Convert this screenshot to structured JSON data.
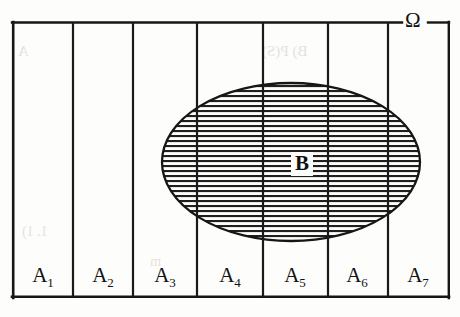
{
  "figure": {
    "type": "venn-partition-diagram",
    "universe_label": "Ω",
    "set_label": "B",
    "partition_labels": [
      {
        "base": "A",
        "sub": "1"
      },
      {
        "base": "A",
        "sub": "2"
      },
      {
        "base": "A",
        "sub": "3"
      },
      {
        "base": "A",
        "sub": "4"
      },
      {
        "base": "A",
        "sub": "5"
      },
      {
        "base": "A",
        "sub": "6"
      },
      {
        "base": "A",
        "sub": "7"
      }
    ],
    "colors": {
      "ink": "#161616",
      "hatch": "#1f1f1f",
      "paper": "#fdfdfc",
      "bleed": "#e4e2de"
    },
    "geometry": {
      "rect": {
        "x": 12,
        "y": 22,
        "width": 438,
        "height": 276
      },
      "dividers_x": [
        73,
        133,
        197,
        263,
        328,
        388
      ],
      "ellipse": {
        "cx": 291,
        "cy": 162,
        "rx": 129,
        "ry": 79
      },
      "hatch_spacing": 5,
      "omega_gap": {
        "x1": 402,
        "x2": 428
      }
    }
  },
  "bleed_through": [
    {
      "text": "B) P(S)",
      "x": 262,
      "y": 52,
      "size": 15
    },
    {
      "text": "A",
      "x": 18,
      "y": 52,
      "size": 15
    },
    {
      "text": "1. 1)",
      "x": 22,
      "y": 232,
      "size": 14
    },
    {
      "text": "m",
      "x": 150,
      "y": 262,
      "size": 14
    }
  ]
}
